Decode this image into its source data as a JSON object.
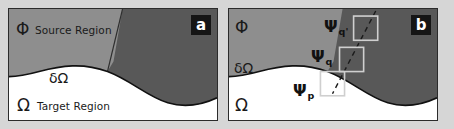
{
  "figure": {
    "background_color": "#d6d6d6",
    "panel_border_color": "#2b2b2b"
  },
  "colors": {
    "source_region_fill": "#8e8e8e",
    "occluded_region_fill": "#585858",
    "target_region_fill": "#ffffff",
    "boundary_stroke": "#111111",
    "patch_outline": "#cfcfcf",
    "dashed_line": "#1a1a1a",
    "badge_background": "#151515",
    "badge_text": "#ffffff",
    "label_text": "#1a1a1a"
  },
  "panel_a": {
    "badge": "a",
    "source_symbol": "Φ",
    "source_label": "Source Region",
    "boundary_symbol": "δΩ",
    "target_symbol": "Ω",
    "target_label": "Target Region"
  },
  "panel_b": {
    "badge": "b",
    "source_symbol": "Φ",
    "boundary_symbol": "δΩ",
    "target_symbol": "Ω",
    "patches": [
      {
        "symbol": "Ψ",
        "subscript": "q'"
      },
      {
        "symbol": "Ψ",
        "subscript": "q"
      },
      {
        "symbol": "Ψ",
        "subscript": "p"
      }
    ]
  }
}
